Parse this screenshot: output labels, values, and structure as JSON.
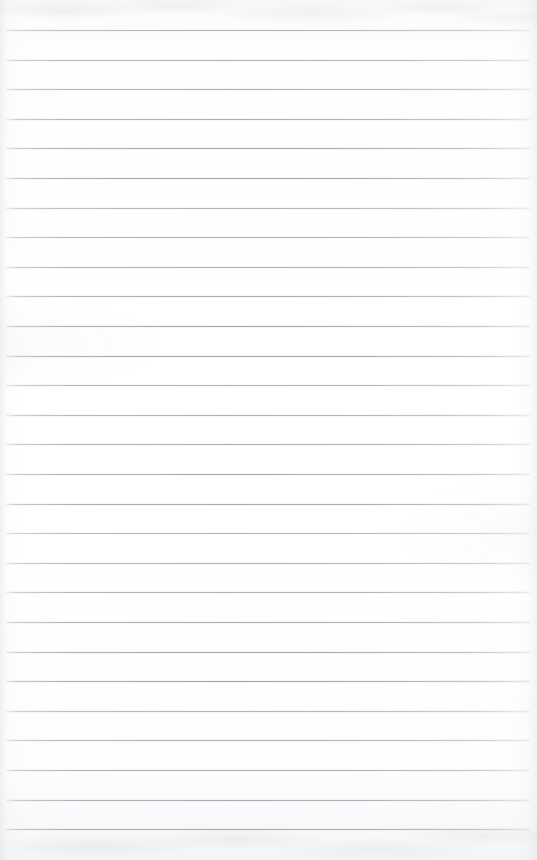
{
  "document": {
    "kind": "blank-ruled-notebook-paper",
    "title": "Blank Ruled Paper",
    "width_px": 537,
    "height_px": 860,
    "text_content": "",
    "has_text": false,
    "has_margin_rule": false,
    "has_header": false,
    "has_holes": false
  },
  "paper": {
    "background_color": "#fdfdfd",
    "top_edge_tint": "#f6f7f8",
    "bottom_edge_tint": "#f4f5f6",
    "grain_description": "faint grey scan mottling along top and bottom edges"
  },
  "ruling": {
    "line_color": "#98a0a8",
    "line_count": 28,
    "line_thickness_px": 1,
    "first_line_y": 30,
    "line_spacing_px": 29.6,
    "line_start_x": 6,
    "line_end_x": 530,
    "fade_ends": true,
    "lines_y": [
      30,
      59.6,
      89.2,
      118.8,
      148.4,
      178,
      207.6,
      237.2,
      266.8,
      296.4,
      326,
      355.6,
      385.2,
      414.8,
      444.4,
      474,
      503.6,
      533.2,
      562.8,
      592.4,
      622,
      651.6,
      681.2,
      710.8,
      740.4,
      770,
      799.6,
      829.2
    ]
  }
}
